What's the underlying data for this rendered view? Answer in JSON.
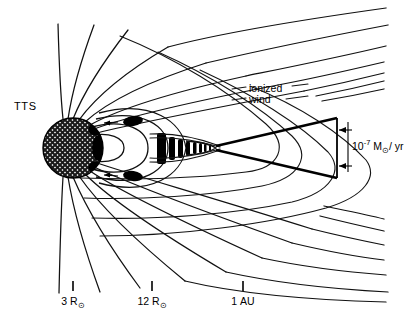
{
  "figure": {
    "background_color": "#ffffff",
    "line_color": "#111111",
    "width": 416,
    "height": 325
  },
  "star": {
    "label": "TTS",
    "name": "t-tauri-star",
    "center_x": 73,
    "center_y": 148,
    "radius": 30,
    "fill_pattern": "cross-hatch"
  },
  "wind": {
    "label_line1": "ionized",
    "label_line2": "wind",
    "mass_loss_rate": {
      "mantissa": "10",
      "exponent": "-7",
      "unit_mass": "M",
      "unit_sun": "⊙",
      "unit_time": "/ yr",
      "full_text": "10-7 M⊙/yr"
    }
  },
  "scale_axis": {
    "name": "distance-scale",
    "ticks": [
      {
        "label_value": "3",
        "label_unit": "R",
        "label_sun": "⊙",
        "x": 73
      },
      {
        "label_value": "12",
        "label_unit": "R",
        "label_sun": "⊙",
        "x": 152
      },
      {
        "label_value": "1",
        "label_unit": "AU",
        "label_sun": "",
        "x": 243
      }
    ]
  },
  "features": {
    "plasma_blob_upper": "plasma-blob-upper",
    "plasma_blob_lower": "plasma-blob-lower",
    "current_sheet": "current-sheet-plasmoid",
    "closed_loops": "closed-magnetic-loops",
    "open_field_lines": "open-field-lines",
    "jet_cone": "ionized-wind-cone"
  }
}
